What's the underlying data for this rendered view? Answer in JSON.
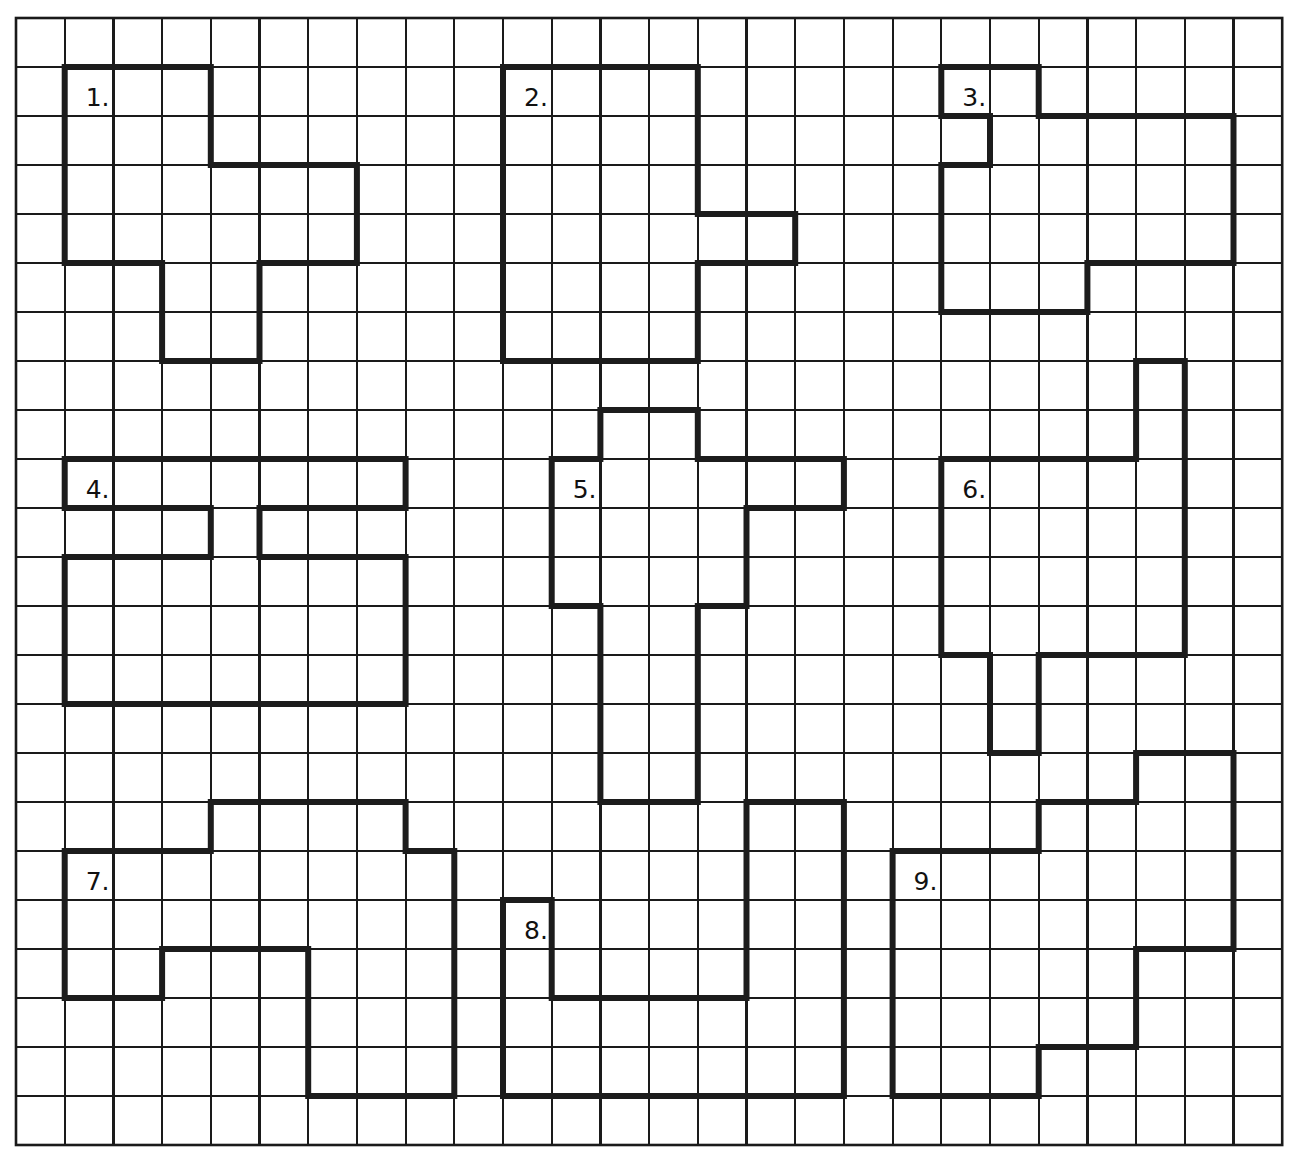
{
  "worksheet": {
    "title": "Grid shapes worksheet",
    "grid": {
      "columns": 26,
      "rows": 23,
      "origin_x": 16,
      "origin_y": 18,
      "cell_width": 48.7,
      "cell_height": 49,
      "line_color": "#1a1a1a",
      "background": "#ffffff"
    },
    "shape_style": {
      "stroke_color": "#1c1c1c",
      "stroke_width": 6
    },
    "shapes": [
      {
        "number": 1,
        "label": "1.",
        "label_cell": [
          1,
          1
        ],
        "vertices": [
          [
            1,
            1
          ],
          [
            4,
            1
          ],
          [
            4,
            3
          ],
          [
            7,
            3
          ],
          [
            7,
            5
          ],
          [
            5,
            5
          ],
          [
            5,
            7
          ],
          [
            3,
            7
          ],
          [
            3,
            5
          ],
          [
            1,
            5
          ]
        ]
      },
      {
        "number": 2,
        "label": "2.",
        "label_cell": [
          10,
          1
        ],
        "vertices": [
          [
            10,
            1
          ],
          [
            14,
            1
          ],
          [
            14,
            4
          ],
          [
            16,
            4
          ],
          [
            16,
            5
          ],
          [
            14,
            5
          ],
          [
            14,
            7
          ],
          [
            10,
            7
          ]
        ]
      },
      {
        "number": 3,
        "label": "3.",
        "label_cell": [
          19,
          1
        ],
        "vertices": [
          [
            19,
            1
          ],
          [
            21,
            1
          ],
          [
            21,
            2
          ],
          [
            25,
            2
          ],
          [
            25,
            5
          ],
          [
            22,
            5
          ],
          [
            22,
            6
          ],
          [
            19,
            6
          ],
          [
            19,
            3
          ],
          [
            20,
            3
          ],
          [
            20,
            2
          ],
          [
            19,
            2
          ]
        ]
      },
      {
        "number": 4,
        "label": "4.",
        "label_cell": [
          1,
          9
        ],
        "vertices": [
          [
            1,
            9
          ],
          [
            8,
            9
          ],
          [
            8,
            10
          ],
          [
            5,
            10
          ],
          [
            5,
            11
          ],
          [
            8,
            11
          ],
          [
            8,
            14
          ],
          [
            1,
            14
          ],
          [
            1,
            11
          ],
          [
            4,
            11
          ],
          [
            4,
            10
          ],
          [
            1,
            10
          ]
        ]
      },
      {
        "number": 5,
        "label": "5.",
        "label_cell": [
          11,
          9
        ],
        "vertices": [
          [
            12,
            8
          ],
          [
            14,
            8
          ],
          [
            14,
            9
          ],
          [
            17,
            9
          ],
          [
            17,
            10
          ],
          [
            15,
            10
          ],
          [
            15,
            12
          ],
          [
            14,
            12
          ],
          [
            14,
            16
          ],
          [
            12,
            16
          ],
          [
            12,
            12
          ],
          [
            11,
            12
          ],
          [
            11,
            9
          ],
          [
            12,
            9
          ]
        ]
      },
      {
        "number": 6,
        "label": "6.",
        "label_cell": [
          19,
          9
        ],
        "vertices": [
          [
            23,
            7
          ],
          [
            24,
            7
          ],
          [
            24,
            13
          ],
          [
            21,
            13
          ],
          [
            21,
            15
          ],
          [
            20,
            15
          ],
          [
            20,
            13
          ],
          [
            19,
            13
          ],
          [
            19,
            9
          ],
          [
            23,
            9
          ]
        ]
      },
      {
        "number": 7,
        "label": "7.",
        "label_cell": [
          1,
          17
        ],
        "vertices": [
          [
            4,
            16
          ],
          [
            8,
            16
          ],
          [
            8,
            17
          ],
          [
            9,
            17
          ],
          [
            9,
            22
          ],
          [
            6,
            22
          ],
          [
            6,
            19
          ],
          [
            3,
            19
          ],
          [
            3,
            20
          ],
          [
            1,
            20
          ],
          [
            1,
            17
          ],
          [
            4,
            17
          ]
        ]
      },
      {
        "number": 8,
        "label": "8.",
        "label_cell": [
          10,
          18
        ],
        "vertices": [
          [
            15,
            16
          ],
          [
            17,
            16
          ],
          [
            17,
            22
          ],
          [
            10,
            22
          ],
          [
            10,
            18
          ],
          [
            11,
            18
          ],
          [
            11,
            20
          ],
          [
            15,
            20
          ]
        ]
      },
      {
        "number": 9,
        "label": "9.",
        "label_cell": [
          18,
          17
        ],
        "vertices": [
          [
            23,
            15
          ],
          [
            25,
            15
          ],
          [
            25,
            19
          ],
          [
            23,
            19
          ],
          [
            23,
            21
          ],
          [
            21,
            21
          ],
          [
            21,
            22
          ],
          [
            18,
            22
          ],
          [
            18,
            17
          ],
          [
            21,
            17
          ],
          [
            21,
            16
          ],
          [
            23,
            16
          ]
        ]
      }
    ]
  }
}
